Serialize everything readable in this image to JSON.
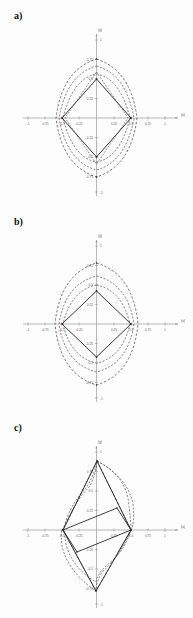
{
  "figure": {
    "background": "#fdfdfd",
    "axis_color": "#9a9a9a",
    "curve_solid_color": "#2b2b2b",
    "curve_dashed_color": "#3a3a3a",
    "tick_label_color": "#5d5d5d"
  },
  "axes": {
    "xlabel": "(x)",
    "ylabel": "(y)",
    "xlim": [
      -1,
      1
    ],
    "ylim": [
      -1,
      1
    ],
    "grid": false,
    "xticks": [
      -1,
      -0.75,
      -0.5,
      -0.25,
      0.25,
      0.5,
      0.75,
      1
    ],
    "xtick_labels": [
      "-1",
      "-0.75",
      "-0.5",
      "-0.25",
      "0.25",
      "0.5",
      "0.75",
      "1"
    ],
    "yticks": [
      1,
      0.75,
      0.5,
      0.25,
      -0.25,
      -0.5,
      -0.75,
      -1
    ],
    "ytick_labels": [
      "1",
      "0.75",
      "0.5",
      "0.25",
      "-0.25",
      "-0.5",
      "-0.75",
      "-1"
    ]
  },
  "panels": [
    {
      "id": "a",
      "label": "a)",
      "description": "Symmetric diamond orbit with nested dashed outer orbits",
      "solid_diamond": [
        [
          0,
          0.5
        ],
        [
          0.5,
          0
        ],
        [
          0,
          -0.5
        ],
        [
          -0.5,
          0
        ]
      ],
      "dashed_orbits": [
        [
          [
            0,
            0.56
          ],
          [
            0.52,
            0
          ],
          [
            0,
            -0.56
          ],
          [
            -0.52,
            0
          ]
        ],
        [
          [
            0,
            0.66
          ],
          [
            0.54,
            0
          ],
          [
            0,
            -0.66
          ],
          [
            -0.54,
            0
          ]
        ],
        [
          [
            0,
            0.75
          ],
          [
            0.55,
            0
          ],
          [
            0,
            -0.75
          ],
          [
            -0.55,
            0
          ]
        ]
      ]
    },
    {
      "id": "b",
      "label": "b)",
      "description": "Symmetric diamond orbit, wider dashed outer orbits",
      "solid_diamond": [
        [
          0,
          0.42
        ],
        [
          0.5,
          0
        ],
        [
          0,
          -0.42
        ],
        [
          -0.5,
          0
        ]
      ],
      "dashed_orbits": [
        [
          [
            0,
            0.5
          ],
          [
            0.53,
            0
          ],
          [
            0,
            -0.5
          ],
          [
            -0.53,
            0
          ]
        ],
        [
          [
            0,
            0.62
          ],
          [
            0.56,
            0
          ],
          [
            0,
            -0.62
          ],
          [
            -0.56,
            0
          ]
        ],
        [
          [
            0,
            0.78
          ],
          [
            0.58,
            0
          ],
          [
            0,
            -0.78
          ],
          [
            -0.58,
            0
          ]
        ]
      ]
    },
    {
      "id": "c",
      "label": "c)",
      "description": "Asymmetric tilted orbit, point-symmetric about origin",
      "solid_diamond": [
        [
          0,
          0.85
        ],
        [
          0.5,
          0
        ],
        [
          0,
          -0.85
        ],
        [
          -0.5,
          0
        ]
      ],
      "dashed_orbits": [
        [
          [
            0.05,
            0.78
          ],
          [
            0.52,
            0
          ],
          [
            -0.05,
            -0.78
          ],
          [
            -0.52,
            0
          ]
        ],
        [
          [
            0.1,
            0.7
          ],
          [
            0.55,
            0
          ],
          [
            -0.1,
            -0.7
          ],
          [
            -0.55,
            0
          ]
        ],
        [
          [
            0.15,
            0.6
          ],
          [
            0.58,
            0
          ],
          [
            -0.15,
            -0.6
          ],
          [
            -0.58,
            0
          ]
        ]
      ]
    }
  ]
}
